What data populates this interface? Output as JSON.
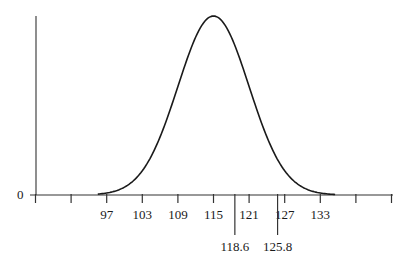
{
  "chart_data": {
    "type": "line",
    "title": "",
    "xlabel": "",
    "ylabel": "",
    "distribution": {
      "kind": "normal",
      "mean": 115,
      "sd": 6
    },
    "x_ticks": [
      85,
      91,
      97,
      103,
      109,
      115,
      121,
      127,
      133,
      139,
      145
    ],
    "x_tick_labels": [
      "",
      "",
      "97",
      "103",
      "109",
      "115",
      "121",
      "127",
      "133",
      "",
      ""
    ],
    "y_tick_labels": [
      "0"
    ],
    "markers": [
      {
        "x": 118.6,
        "label": "118.6"
      },
      {
        "x": 125.8,
        "label": "125.8"
      }
    ],
    "xlim": [
      79,
      145
    ],
    "grid": false,
    "legend": null,
    "colors": {
      "line": "#1a1a1a",
      "axis": "#333333"
    }
  }
}
